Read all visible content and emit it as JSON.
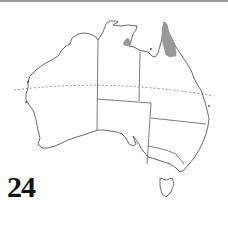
{
  "figure": {
    "label": "24",
    "colors": {
      "outline": "#444444",
      "distribution": "#999999",
      "tropic_line": "#666666"
    },
    "shaded_regions": [
      {
        "name": "Cape York Peninsula"
      },
      {
        "name": "Gulf of Carpentaria (NT, western Gulf)"
      }
    ],
    "reference_line": "Tropic of Capricorn"
  }
}
